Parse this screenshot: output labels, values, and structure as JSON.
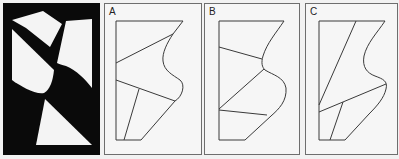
{
  "figure": {
    "background": "#f2f2f2",
    "stroke_color": "#3a3a3a",
    "panels": [
      {
        "id": "source",
        "label": "",
        "fill": "#0a0a0a"
      },
      {
        "id": "A",
        "label": "A"
      },
      {
        "id": "B",
        "label": "B"
      },
      {
        "id": "C",
        "label": "C"
      }
    ]
  }
}
